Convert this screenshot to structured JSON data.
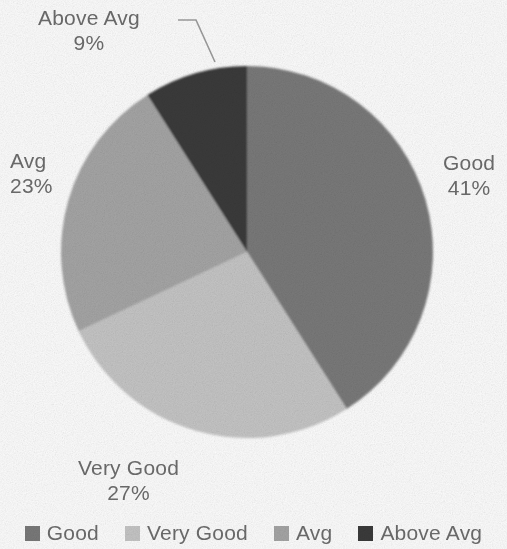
{
  "chart_data": {
    "type": "pie",
    "title": "",
    "subtitle": "",
    "xlabel": "",
    "ylabel": "",
    "grid": false,
    "legend_position": "bottom",
    "units": "percent",
    "total": 100,
    "start_angle_deg": 0,
    "direction": "clockwise",
    "categories": [
      "Good",
      "Very Good",
      "Avg",
      "Above Avg"
    ],
    "values": [
      41,
      27,
      23,
      9
    ],
    "colors": [
      "#7a7a7a",
      "#c6c6c6",
      "#a6a6a6",
      "#3b3b3b"
    ],
    "slices": [
      {
        "label": "Good",
        "value": 41,
        "value_text": "41%",
        "color": "#7a7a7a",
        "start_deg": 0,
        "end_deg": 147.6,
        "label_position": "outside-right",
        "leader_line": false
      },
      {
        "label": "Very Good",
        "value": 27,
        "value_text": "27%",
        "color": "#c6c6c6",
        "start_deg": 147.6,
        "end_deg": 244.8,
        "label_position": "outside-bottom",
        "leader_line": false
      },
      {
        "label": "Avg",
        "value": 23,
        "value_text": "23%",
        "color": "#a6a6a6",
        "start_deg": 244.8,
        "end_deg": 327.6,
        "label_position": "outside-left",
        "leader_line": false
      },
      {
        "label": "Above Avg",
        "value": 9,
        "value_text": "9%",
        "color": "#3b3b3b",
        "start_deg": 327.6,
        "end_deg": 360,
        "label_position": "outside-top-left",
        "leader_line": true
      }
    ]
  },
  "labels": {
    "above_avg": {
      "name": "Above Avg",
      "value": "9%"
    },
    "avg": {
      "name": "Avg",
      "value": "23%"
    },
    "good": {
      "name": "Good",
      "value": "41%"
    },
    "very_good": {
      "name": "Very Good",
      "value": "27%"
    }
  },
  "legend": {
    "items": [
      {
        "label": "Good",
        "color": "#7a7a7a",
        "swatch_icon": "square-swatch-icon"
      },
      {
        "label": "Very Good",
        "color": "#c6c6c6",
        "swatch_icon": "square-swatch-icon"
      },
      {
        "label": "Avg",
        "color": "#a6a6a6",
        "swatch_icon": "square-swatch-icon"
      },
      {
        "label": "Above Avg",
        "color": "#3b3b3b",
        "swatch_icon": "square-swatch-icon"
      }
    ]
  },
  "style": {
    "background": "#fefefe",
    "text_color": "#6d6d6d",
    "leader_line_color": "#9a9a9a",
    "center_x": 247,
    "center_y": 252,
    "radius": 186
  }
}
